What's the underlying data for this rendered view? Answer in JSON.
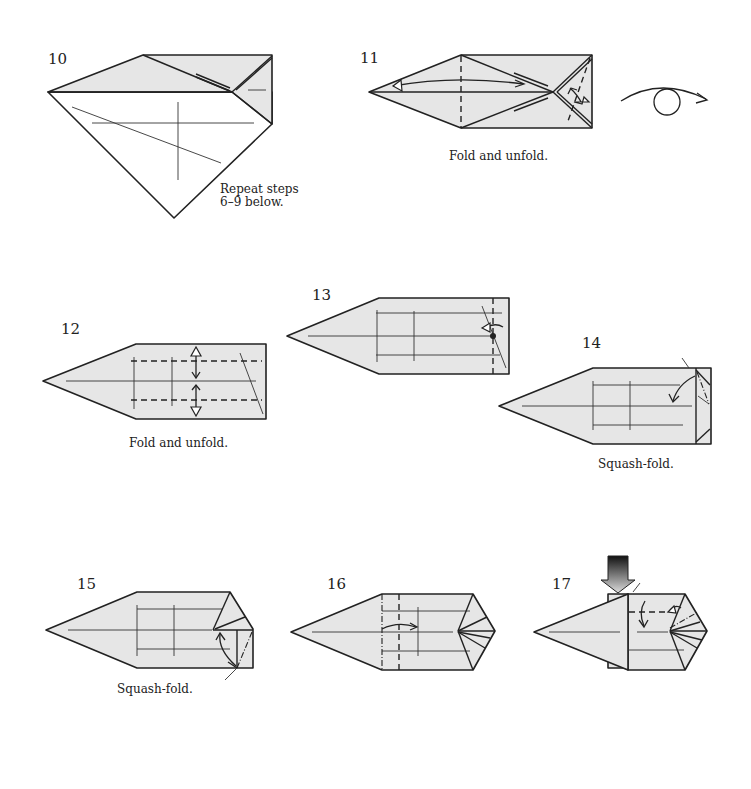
{
  "page": {
    "background": "#ffffff",
    "paper_color": "#e6e6e6",
    "line_color": "#222222"
  },
  "steps": [
    {
      "number": "10",
      "caption": "Repeat steps",
      "caption_line2": "6–9 below.",
      "icons": [
        "pleat-layers-icon"
      ]
    },
    {
      "number": "11",
      "caption": "Fold and unfold.",
      "icons": [
        "fold-unfold-arrow-icon",
        "turn-over-icon"
      ]
    },
    {
      "number": "12",
      "caption": "Fold and unfold.",
      "icons": [
        "fold-unfold-arrow-icon"
      ]
    },
    {
      "number": "13",
      "caption": "",
      "icons": [
        "reverse-fold-arrow-icon"
      ]
    },
    {
      "number": "14",
      "caption": "Squash-fold.",
      "icons": [
        "squash-arrow-icon"
      ]
    },
    {
      "number": "15",
      "caption": "Squash-fold.",
      "icons": [
        "squash-arrow-icon"
      ]
    },
    {
      "number": "16",
      "caption": "",
      "icons": [
        "pleat-arrow-icon"
      ]
    },
    {
      "number": "17",
      "caption": "",
      "icons": [
        "push-arrow-icon",
        "fold-arrow-icon"
      ]
    }
  ]
}
